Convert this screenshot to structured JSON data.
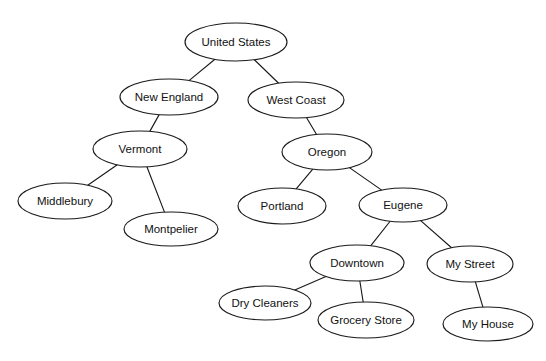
{
  "diagram": {
    "type": "tree",
    "background_color": "#ffffff",
    "node_fill_color": "#ffffff",
    "node_stroke_color": "#1a1a1a",
    "edge_color": "#1a1a1a",
    "text_color": "#111111",
    "nodes": [
      {
        "id": "united-states",
        "label": "United States",
        "cx": 236,
        "cy": 42,
        "rx": 51,
        "ry": 19
      },
      {
        "id": "new-england",
        "label": "New England",
        "cx": 169,
        "cy": 97,
        "rx": 49,
        "ry": 18
      },
      {
        "id": "west-coast",
        "label": "West Coast",
        "cx": 296,
        "cy": 100,
        "rx": 48,
        "ry": 18
      },
      {
        "id": "vermont",
        "label": "Vermont",
        "cx": 140,
        "cy": 149,
        "rx": 47,
        "ry": 18
      },
      {
        "id": "oregon",
        "label": "Oregon",
        "cx": 327,
        "cy": 152,
        "rx": 45,
        "ry": 18
      },
      {
        "id": "middlebury",
        "label": "Middlebury",
        "cx": 65,
        "cy": 201,
        "rx": 47,
        "ry": 18
      },
      {
        "id": "montpelier",
        "label": "Montpelier",
        "cx": 171,
        "cy": 229,
        "rx": 47,
        "ry": 17
      },
      {
        "id": "portland",
        "label": "Portland",
        "cx": 282,
        "cy": 206,
        "rx": 44,
        "ry": 18
      },
      {
        "id": "eugene",
        "label": "Eugene",
        "cx": 403,
        "cy": 205,
        "rx": 44,
        "ry": 17
      },
      {
        "id": "downtown",
        "label": "Downtown",
        "cx": 357,
        "cy": 263,
        "rx": 47,
        "ry": 18
      },
      {
        "id": "my-street",
        "label": "My Street",
        "cx": 470,
        "cy": 264,
        "rx": 43,
        "ry": 18
      },
      {
        "id": "dry-cleaners",
        "label": "Dry Cleaners",
        "cx": 265,
        "cy": 303,
        "rx": 46,
        "ry": 17
      },
      {
        "id": "grocery-store",
        "label": "Grocery Store",
        "cx": 366,
        "cy": 320,
        "rx": 48,
        "ry": 18
      },
      {
        "id": "my-house",
        "label": "My House",
        "cx": 488,
        "cy": 324,
        "rx": 45,
        "ry": 17
      }
    ],
    "edges": [
      {
        "from": "united-states",
        "to": "new-england"
      },
      {
        "from": "united-states",
        "to": "west-coast"
      },
      {
        "from": "new-england",
        "to": "vermont"
      },
      {
        "from": "vermont",
        "to": "middlebury"
      },
      {
        "from": "vermont",
        "to": "montpelier"
      },
      {
        "from": "west-coast",
        "to": "oregon"
      },
      {
        "from": "oregon",
        "to": "portland"
      },
      {
        "from": "oregon",
        "to": "eugene"
      },
      {
        "from": "eugene",
        "to": "downtown"
      },
      {
        "from": "eugene",
        "to": "my-street"
      },
      {
        "from": "downtown",
        "to": "dry-cleaners"
      },
      {
        "from": "downtown",
        "to": "grocery-store"
      },
      {
        "from": "my-street",
        "to": "my-house"
      }
    ]
  }
}
